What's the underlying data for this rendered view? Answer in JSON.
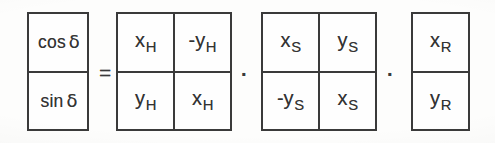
{
  "equation": {
    "description": "cos delta / sin delta column vector equals H rotation matrix times S rotation matrix times R column vector",
    "operators": {
      "equals": "=",
      "multiply_1": "·",
      "multiply_2": "·"
    },
    "lhs_vector": {
      "name": "direction-vector",
      "rows": [
        {
          "prefix": "cos",
          "symbol": "δ"
        },
        {
          "prefix": "sin",
          "symbol": "δ"
        }
      ]
    },
    "matrix_h": {
      "name": "matrix-h",
      "rows": [
        [
          {
            "sign": "",
            "base": "x",
            "sub": "H"
          },
          {
            "sign": "-",
            "base": "y",
            "sub": "H"
          }
        ],
        [
          {
            "sign": "",
            "base": "y",
            "sub": "H"
          },
          {
            "sign": "",
            "base": "x",
            "sub": "H"
          }
        ]
      ]
    },
    "matrix_s": {
      "name": "matrix-s",
      "rows": [
        [
          {
            "sign": "",
            "base": "x",
            "sub": "S"
          },
          {
            "sign": "",
            "base": "y",
            "sub": "S"
          }
        ],
        [
          {
            "sign": "-",
            "base": "y",
            "sub": "S"
          },
          {
            "sign": "",
            "base": "x",
            "sub": "S"
          }
        ]
      ]
    },
    "rhs_vector": {
      "name": "vector-r",
      "rows": [
        [
          {
            "sign": "",
            "base": "x",
            "sub": "R"
          }
        ],
        [
          {
            "sign": "",
            "base": "y",
            "sub": "R"
          }
        ]
      ]
    }
  },
  "colors": {
    "ink": "#3a3a3a",
    "paper": "#fdfdfc"
  }
}
